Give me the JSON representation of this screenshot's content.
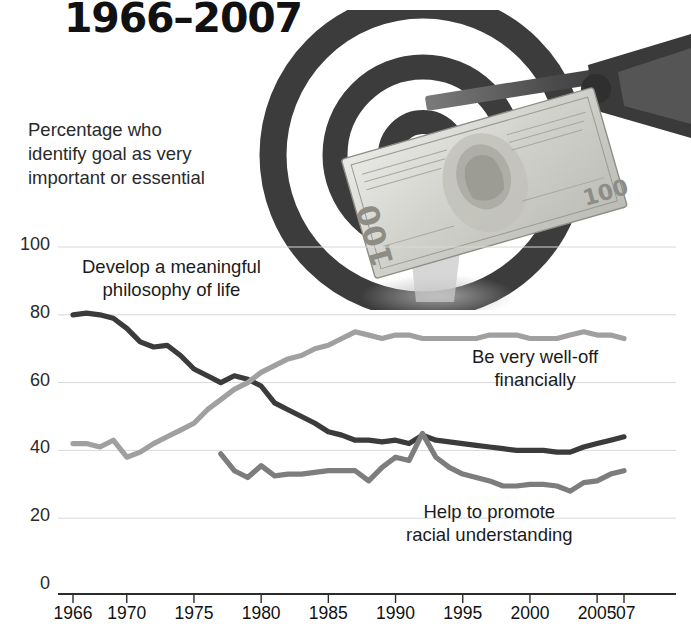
{
  "title": "1966–2007",
  "subtitle": "Percentage who\nidentify goal as very\nimportant or essential",
  "labels": {
    "philosophy": "Develop a meaningful\nphilosophy of life",
    "welloff": "Be very well-off\nfinancially",
    "racial": "Help to promote\nracial understanding"
  },
  "artwork": {
    "dartboard_alt": "dartboard-photo",
    "dart_alt": "dart-icon",
    "banknote_alt": "hundred-dollar-bill",
    "banknote_denomination": "100"
  },
  "colors": {
    "philosophy": "#3b3b3b",
    "welloff": "#a0a0a0",
    "racial": "#7d7d7d",
    "grid": "#d8d8d8",
    "axis": "#2b2b2b",
    "text": "#1b1b1b"
  },
  "chart_data": {
    "type": "line",
    "title": "1966–2007",
    "subtitle": "Percentage who identify goal as very important or essential",
    "xlabel": "",
    "ylabel": "Percentage who identify goal as very important or essential",
    "ylim": [
      0,
      100
    ],
    "yticks": [
      0,
      20,
      40,
      60,
      80,
      100
    ],
    "ytick_labels": [
      "0",
      "20",
      "40",
      "60",
      "80",
      "100"
    ],
    "xlim": [
      1966,
      2007
    ],
    "xticks": [
      1966,
      1970,
      1975,
      1980,
      1985,
      1990,
      1995,
      2000,
      2005,
      2007
    ],
    "xtick_labels": [
      "1966",
      "1970",
      "1975",
      "1980",
      "1985",
      "1990",
      "1995",
      "2000",
      "2005",
      "'07"
    ],
    "grid": true,
    "legend": "inline-annotations",
    "series": [
      {
        "name": "Develop a meaningful philosophy of life",
        "color": "#3b3b3b",
        "x": [
          1966,
          1967,
          1968,
          1969,
          1970,
          1971,
          1972,
          1973,
          1974,
          1975,
          1976,
          1977,
          1978,
          1979,
          1980,
          1981,
          1982,
          1983,
          1984,
          1985,
          1986,
          1987,
          1988,
          1989,
          1990,
          1991,
          1992,
          1993,
          1994,
          1995,
          1996,
          1997,
          1998,
          1999,
          2000,
          2001,
          2002,
          2003,
          2004,
          2005,
          2006,
          2007
        ],
        "values": [
          80,
          80.5,
          80,
          79,
          76,
          72,
          70.5,
          71,
          68,
          64,
          62,
          60,
          62,
          61,
          59,
          54,
          52,
          50,
          48,
          45.5,
          44.5,
          43,
          43,
          42.5,
          43,
          42,
          44.5,
          43,
          42.5,
          42,
          41.5,
          41,
          40.5,
          40,
          40,
          40,
          39.5,
          39.5,
          41,
          42,
          43,
          44
        ]
      },
      {
        "name": "Be very well-off financially",
        "color": "#a0a0a0",
        "x": [
          1966,
          1967,
          1968,
          1969,
          1970,
          1971,
          1972,
          1973,
          1974,
          1975,
          1976,
          1977,
          1978,
          1979,
          1980,
          1981,
          1982,
          1983,
          1984,
          1985,
          1986,
          1987,
          1988,
          1989,
          1990,
          1991,
          1992,
          1993,
          1994,
          1995,
          1996,
          1997,
          1998,
          1999,
          2000,
          2001,
          2002,
          2003,
          2004,
          2005,
          2006,
          2007
        ],
        "values": [
          42,
          42,
          41,
          43,
          38,
          39.5,
          42,
          44,
          46,
          48,
          52,
          55,
          58,
          60,
          63,
          65,
          67,
          68,
          70,
          71,
          73,
          75,
          74,
          73,
          74,
          74,
          73,
          73,
          73,
          73,
          73,
          74,
          74,
          74,
          73,
          73,
          73,
          74,
          75,
          74,
          74,
          73
        ]
      },
      {
        "name": "Help to promote racial understanding",
        "color": "#7d7d7d",
        "x": [
          1977,
          1978,
          1979,
          1980,
          1981,
          1982,
          1983,
          1984,
          1985,
          1986,
          1987,
          1988,
          1989,
          1990,
          1991,
          1992,
          1993,
          1994,
          1995,
          1996,
          1997,
          1998,
          1999,
          2000,
          2001,
          2002,
          2003,
          2004,
          2005,
          2006,
          2007
        ],
        "values": [
          39,
          34,
          32,
          35.5,
          32.5,
          33,
          33,
          33.5,
          34,
          34,
          34,
          31,
          35,
          38,
          37,
          45,
          38,
          35,
          33,
          32,
          31,
          29.5,
          29.5,
          30,
          30,
          29.5,
          28,
          30.5,
          31,
          33,
          34
        ]
      }
    ]
  }
}
